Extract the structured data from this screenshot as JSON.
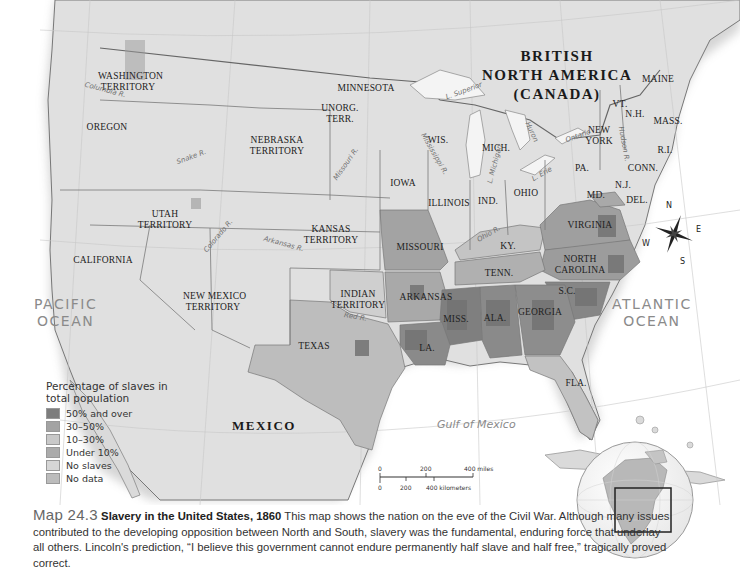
{
  "map": {
    "title_number": "Map 24.3",
    "title": "Slavery in the United States, 1860",
    "caption": "This map shows the nation on the eve of the Civil War. Although many issues contributed to the developing opposition between North and South, slavery was the fundamental, enduring force that underlay all others. Lincoln's prediction, “I believe this government cannot endure permanently half slave and half free,” tragically proved correct.",
    "colors": {
      "water": "#f6f6f6",
      "land": "#dcdcdc",
      "over50": "#7d7d7d",
      "p30_50": "#9c9c9c",
      "p10_30": "#bdbdbd",
      "under10": "#a9a9a9",
      "no_slaves": "#d8d8d8",
      "no_data": "#c4c4c4",
      "border": "#6a6a6a"
    }
  },
  "labels": {
    "canada": [
      "BRITISH",
      "NORTH AMERICA",
      "(CANADA)"
    ],
    "mexico": "MEXICO",
    "pacific": [
      "PACIFIC",
      "OCEAN"
    ],
    "atlantic": [
      "ATLANTIC",
      "OCEAN"
    ],
    "gulf": "Gulf of Mexico",
    "regions": [
      {
        "id": "washington",
        "text": [
          "WASHINGTON",
          "TERRITORY"
        ],
        "x": 128,
        "y": 76
      },
      {
        "id": "oregon",
        "text": [
          "OREGON"
        ],
        "x": 107,
        "y": 127
      },
      {
        "id": "unorg",
        "text": [
          "UNORG.",
          "TERR."
        ],
        "x": 340,
        "y": 108
      },
      {
        "id": "minnesota",
        "text": [
          "MINNESOTA"
        ],
        "x": 366,
        "y": 88
      },
      {
        "id": "nebraska",
        "text": [
          "NEBRASKA",
          "TERRITORY"
        ],
        "x": 277,
        "y": 140
      },
      {
        "id": "wis",
        "text": [
          "WIS."
        ],
        "x": 438,
        "y": 140
      },
      {
        "id": "mich",
        "text": [
          "MICH."
        ],
        "x": 496,
        "y": 148
      },
      {
        "id": "newyork",
        "text": [
          "NEW",
          "YORK"
        ],
        "x": 599,
        "y": 130
      },
      {
        "id": "maine",
        "text": [
          "MAINE"
        ],
        "x": 658,
        "y": 79
      },
      {
        "id": "vt",
        "text": [
          "VT."
        ],
        "x": 620,
        "y": 104
      },
      {
        "id": "nh",
        "text": [
          "N.H."
        ],
        "x": 635,
        "y": 114
      },
      {
        "id": "mass",
        "text": [
          "MASS."
        ],
        "x": 668,
        "y": 121
      },
      {
        "id": "ri",
        "text": [
          "R.I."
        ],
        "x": 665,
        "y": 150
      },
      {
        "id": "conn",
        "text": [
          "CONN."
        ],
        "x": 643,
        "y": 168
      },
      {
        "id": "pa",
        "text": [
          "PA."
        ],
        "x": 582,
        "y": 168
      },
      {
        "id": "nj",
        "text": [
          "N.J."
        ],
        "x": 623,
        "y": 185
      },
      {
        "id": "md",
        "text": [
          "MD."
        ],
        "x": 596,
        "y": 195
      },
      {
        "id": "del",
        "text": [
          "DEL."
        ],
        "x": 637,
        "y": 200
      },
      {
        "id": "iowa",
        "text": [
          "IOWA"
        ],
        "x": 403,
        "y": 183
      },
      {
        "id": "illinois",
        "text": [
          "ILLINOIS"
        ],
        "x": 449,
        "y": 203
      },
      {
        "id": "ind",
        "text": [
          "IND."
        ],
        "x": 488,
        "y": 201
      },
      {
        "id": "ohio",
        "text": [
          "OHIO"
        ],
        "x": 526,
        "y": 193
      },
      {
        "id": "utah",
        "text": [
          "UTAH",
          "TERRITORY"
        ],
        "x": 165,
        "y": 214
      },
      {
        "id": "kansas",
        "text": [
          "KANSAS",
          "TERRITORY"
        ],
        "x": 331,
        "y": 229
      },
      {
        "id": "missouri",
        "text": [
          "MISSOURI"
        ],
        "x": 420,
        "y": 247
      },
      {
        "id": "ky",
        "text": [
          "KY."
        ],
        "x": 508,
        "y": 246
      },
      {
        "id": "virginia",
        "text": [
          "VIRGINIA"
        ],
        "x": 590,
        "y": 225
      },
      {
        "id": "california",
        "text": [
          "CALIFORNIA"
        ],
        "x": 103,
        "y": 260
      },
      {
        "id": "ncarolina",
        "text": [
          "NORTH",
          "CAROLINA"
        ],
        "x": 580,
        "y": 259
      },
      {
        "id": "tenn",
        "text": [
          "TENN."
        ],
        "x": 499,
        "y": 273
      },
      {
        "id": "newmexico",
        "text": [
          "NEW MEXICO",
          "TERRITORY"
        ],
        "x": 213,
        "y": 296
      },
      {
        "id": "indian",
        "text": [
          "INDIAN",
          "TERRITORY"
        ],
        "x": 358,
        "y": 294
      },
      {
        "id": "arkansas",
        "text": [
          "ARKANSAS"
        ],
        "x": 426,
        "y": 297
      },
      {
        "id": "sc",
        "text": [
          "S.C."
        ],
        "x": 567,
        "y": 291
      },
      {
        "id": "miss",
        "text": [
          "MISS."
        ],
        "x": 456,
        "y": 319
      },
      {
        "id": "ala",
        "text": [
          "ALA."
        ],
        "x": 495,
        "y": 318
      },
      {
        "id": "georgia",
        "text": [
          "GEORGIA"
        ],
        "x": 540,
        "y": 312
      },
      {
        "id": "texas",
        "text": [
          "TEXAS"
        ],
        "x": 314,
        "y": 346
      },
      {
        "id": "la",
        "text": [
          "LA."
        ],
        "x": 427,
        "y": 348
      },
      {
        "id": "fla",
        "text": [
          "FLA."
        ],
        "x": 576,
        "y": 383
      }
    ],
    "rivers": [
      {
        "text": "Columbia R.",
        "x": 84,
        "y": 86,
        "rot": 15
      },
      {
        "text": "Snake R.",
        "x": 176,
        "y": 153,
        "rot": -20
      },
      {
        "text": "Missouri R.",
        "x": 327,
        "y": 160,
        "rot": -55
      },
      {
        "text": "Colorado R.",
        "x": 198,
        "y": 232,
        "rot": -50
      },
      {
        "text": "Arkansas R.",
        "x": 263,
        "y": 240,
        "rot": 15
      },
      {
        "text": "Red R.",
        "x": 344,
        "y": 313,
        "rot": 10
      },
      {
        "text": "Ohio R.",
        "x": 476,
        "y": 230,
        "rot": -30
      },
      {
        "text": "Mississippi R.",
        "x": 411,
        "y": 150,
        "rot": 60
      },
      {
        "text": "L. Superior",
        "x": 445,
        "y": 87,
        "rot": -20
      },
      {
        "text": "L. Michigan",
        "x": 475,
        "y": 160,
        "rot": -75
      },
      {
        "text": "Huron",
        "x": 521,
        "y": 128,
        "rot": 65
      },
      {
        "text": "L. Erie",
        "x": 531,
        "y": 170,
        "rot": -30
      },
      {
        "text": "Ontario",
        "x": 565,
        "y": 132,
        "rot": -20
      },
      {
        "text": "Hudson R.",
        "x": 606,
        "y": 140,
        "rot": 80
      }
    ],
    "longitudes": [
      "120°W",
      "110°W",
      "100°W",
      "90°W",
      "80°W",
      "70°W",
      "40°N",
      "30°N"
    ]
  },
  "legend": {
    "title": "Percentage of slaves in total population",
    "items": [
      {
        "label": "50% and over",
        "color": "#7d7d7d"
      },
      {
        "label": "30–50%",
        "color": "#a3a3a3"
      },
      {
        "label": "10–30%",
        "color": "#c9c9c9"
      },
      {
        "label": "Under 10%",
        "color": "#ababab"
      },
      {
        "label": "No slaves",
        "color": "#d6d6d6"
      },
      {
        "label": "No data",
        "color": "#bcbcbc"
      }
    ]
  },
  "scale": {
    "miles": [
      "0",
      "200",
      "400 miles"
    ],
    "km": [
      "0",
      "200",
      "400 kilometers"
    ]
  },
  "compass": {
    "n": "N",
    "s": "S",
    "e": "E",
    "w": "W"
  }
}
